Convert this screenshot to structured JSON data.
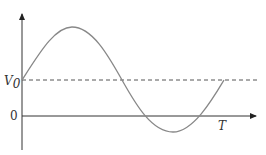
{
  "diagram": {
    "type": "waveform",
    "labels": {
      "v0": "V",
      "v0_sub": "0",
      "zero": "0",
      "period": "T"
    },
    "colors": {
      "axis": "#333333",
      "curve": "#888888",
      "dashed": "#555555"
    }
  }
}
